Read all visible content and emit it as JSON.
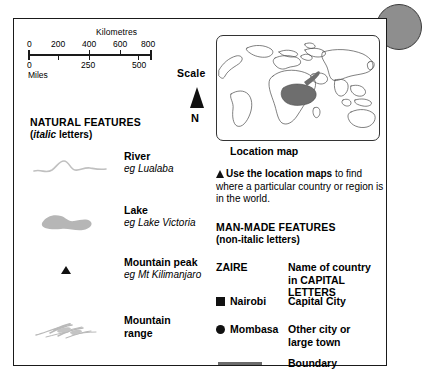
{
  "scale": {
    "kilometres_label": "Kilometres",
    "miles_label": "Miles",
    "km_ticks": [
      "0",
      "200",
      "400",
      "600",
      "800"
    ],
    "miles_ticks": [
      "0",
      "250",
      "500"
    ],
    "scale_word": "Scale",
    "north_letter": "N"
  },
  "natural": {
    "heading": "NATURAL FEATURES",
    "sub_italic": "italic",
    "sub_rest": " letters)",
    "sub_open": "(",
    "rows": [
      {
        "symbol": "river-symbol",
        "title": "River",
        "eg": "eg Lualaba"
      },
      {
        "symbol": "lake-symbol",
        "title": "Lake",
        "eg": "eg Lake Victoria"
      },
      {
        "symbol": "mountain-peak-symbol",
        "title": "Mountain peak",
        "eg": "eg Mt Kilimanjaro"
      },
      {
        "symbol": "mountain-range-symbol",
        "title_line1": "Mountain",
        "title_line2": "range",
        "eg": ""
      }
    ]
  },
  "location_map": {
    "caption": "Location map",
    "highlight_region": "central-east-africa",
    "highlight_color": "#6e6e6e",
    "coastline_color": "#4a4a4a"
  },
  "callout": {
    "bold_text": "Use the location maps",
    "rest_text": " to find where a particular country or region is in the world."
  },
  "manmade": {
    "heading": "MAN-MADE FEATURES",
    "sub": "(non-italic letters)",
    "rows": [
      {
        "key": "ZAIRE",
        "marker": "none",
        "desc_line1": "Name of country",
        "desc_line2": "in CAPITAL LETTERS"
      },
      {
        "key": "Nairobi",
        "marker": "square",
        "desc_line1": "Capital City",
        "desc_line2": ""
      },
      {
        "key": "Mombasa",
        "marker": "circle",
        "desc_line1": "Other city or",
        "desc_line2": "large town"
      },
      {
        "key": "",
        "marker": "line",
        "desc_line1": "Boundary",
        "desc_line2": ""
      }
    ]
  },
  "colors": {
    "frame": "#1a1a1a",
    "river": "#bdbdbd",
    "lake": "#b5b5b5",
    "range": "#c9c9c9",
    "boundary": "#6b6b6b",
    "disc": "#8e8e8e"
  }
}
